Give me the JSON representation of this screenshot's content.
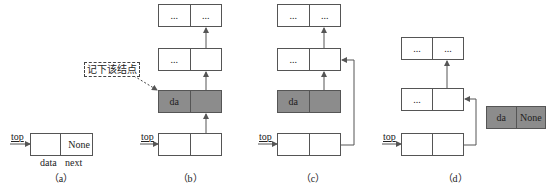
{
  "diagram": {
    "top_label": "top",
    "ellipsis": "...",
    "none_label": "None",
    "data_value": "da",
    "field_labels": {
      "data": "data",
      "next": "next"
    },
    "callout": "记下该结点",
    "colors": {
      "highlight_fill": "#8c8c8c",
      "line": "#555555",
      "background": "#ffffff"
    },
    "panels": [
      {
        "id": "a",
        "label": "（a）",
        "nodes": [
          {
            "data": "",
            "next": "None",
            "highlighted": false
          }
        ]
      },
      {
        "id": "b",
        "label": "（b）",
        "nodes": [
          {
            "data": "...",
            "next": "...",
            "highlighted": false
          },
          {
            "data": "...",
            "next": "",
            "highlighted": false
          },
          {
            "data": "da",
            "next": "",
            "highlighted": true
          },
          {
            "data": "",
            "next": "",
            "highlighted": false,
            "top": true
          }
        ]
      },
      {
        "id": "c",
        "label": "（c）",
        "nodes": [
          {
            "data": "...",
            "next": "...",
            "highlighted": false
          },
          {
            "data": "...",
            "next": "",
            "highlighted": false
          },
          {
            "data": "da",
            "next": "",
            "highlighted": true
          },
          {
            "data": "",
            "next": "",
            "highlighted": false,
            "top": true
          }
        ]
      },
      {
        "id": "d",
        "label": "（d）",
        "nodes": [
          {
            "data": "...",
            "next": "...",
            "highlighted": false
          },
          {
            "data": "...",
            "next": "",
            "highlighted": false
          },
          {
            "data": "",
            "next": "",
            "highlighted": false,
            "top": true
          }
        ],
        "detached": {
          "data": "da",
          "next": "None",
          "highlighted": true
        }
      }
    ]
  }
}
